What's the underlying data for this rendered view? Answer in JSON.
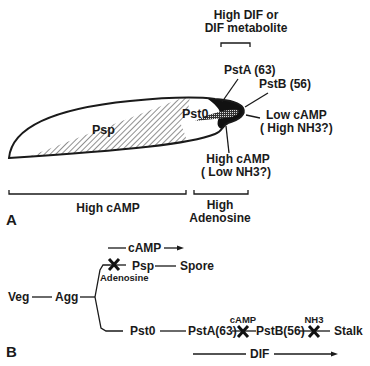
{
  "panel_a": {
    "panel_label": "A",
    "top_annotation_line1": "High DIF or",
    "top_annotation_line2": "DIF metabolite",
    "regions": {
      "psp": "Psp",
      "pst0": "Pst0",
      "psta": "PstA (63)",
      "pstb": "PstB (56)"
    },
    "right_annotation_line1": "Low cAMP",
    "right_annotation_line2": "( High NH3?)",
    "bottom_annotation_line1": "High cAMP",
    "bottom_annotation_line2": "( Low NH3?)",
    "bracket_left_label": "High cAMP",
    "bracket_right_label_line1": "High",
    "bracket_right_label_line2": "Adenosine"
  },
  "panel_b": {
    "panel_label": "B",
    "nodes": {
      "veg": "Veg",
      "agg": "Agg",
      "psp": "Psp",
      "spore": "Spore",
      "pst0": "Pst0",
      "psta": "PstA(63)",
      "pstb": "PstB(56)",
      "stalk": "Stalk"
    },
    "arrows": {
      "camp_top": "cAMP",
      "dif_bottom": "DIF"
    },
    "inhibitors": {
      "adenosine": "Adenosine",
      "camp": "cAMP",
      "nh3": "NH3"
    }
  },
  "colors": {
    "ink": "#1a1a1a",
    "background": "#ffffff",
    "hatch_fill": "#888888"
  }
}
